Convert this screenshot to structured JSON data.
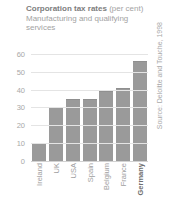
{
  "chart_data": {
    "type": "bar",
    "title": "Corporation tax rates",
    "title_suffix": "(per cent)",
    "subtitle_line1": "Manufacturing and qualifying",
    "subtitle_line2": "services",
    "xlabel": "",
    "ylabel": "",
    "ylim": [
      0,
      65
    ],
    "yticks": [
      0,
      10,
      20,
      30,
      40,
      50,
      60
    ],
    "ytick_labels": [
      "0",
      "10",
      "20",
      "30",
      "40",
      "50",
      "60"
    ],
    "grid": true,
    "legend": "none",
    "source": "Source: Deloitte and Touche, 1998",
    "categories": [
      "Ireland",
      "UK",
      "USA",
      "Spain",
      "Belgium",
      "France",
      "Germany"
    ],
    "values": [
      10,
      30,
      35,
      35,
      39,
      41,
      56
    ],
    "highlight_category": "Germany",
    "bar_color": "#9a9a9a",
    "grid_color": "#e4e4e4",
    "text_color": "#a0a0a0",
    "title_color": "#7d7d7d",
    "background": "#ffffff"
  }
}
